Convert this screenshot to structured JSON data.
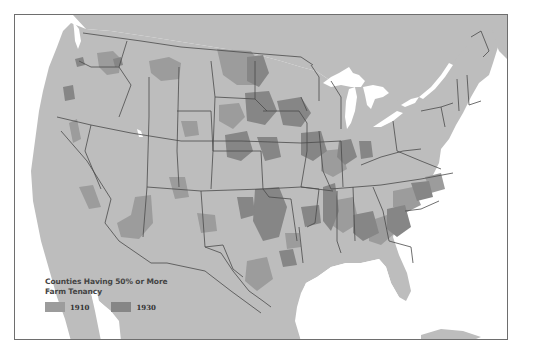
{
  "map": {
    "subject": "United States counties by farm tenancy rate",
    "colors": {
      "water": "#ffffff",
      "land": "#bdbdbd",
      "tenancy_1910": "#9c9c9c",
      "tenancy_1930": "#868686",
      "border": "#4a4a4a",
      "frame": "#6e6e6e"
    }
  },
  "legend": {
    "title_line1": "Counties Having 50% or More",
    "title_line2": "Farm Tenancy",
    "items": [
      {
        "label": "1910",
        "color": "#9c9c9c"
      },
      {
        "label": "1930",
        "color": "#868686"
      }
    ]
  }
}
